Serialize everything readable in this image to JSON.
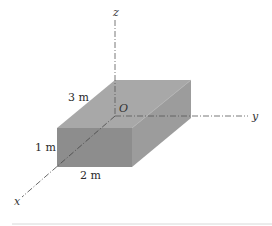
{
  "diagram": {
    "type": "3d-box-on-axes",
    "axes": {
      "x_label": "x",
      "y_label": "y",
      "z_label": "z",
      "origin_label": "O"
    },
    "dimensions": {
      "length_label": "3 m",
      "width_label": "2 m",
      "height_label": "1 m"
    },
    "colors": {
      "top_face": "#a8a8a8",
      "front_face": "#8d8d8d",
      "right_face": "#9c9c9c",
      "axis_line": "#555555",
      "background": "#ffffff",
      "baseline": "#d8d8d8"
    }
  }
}
